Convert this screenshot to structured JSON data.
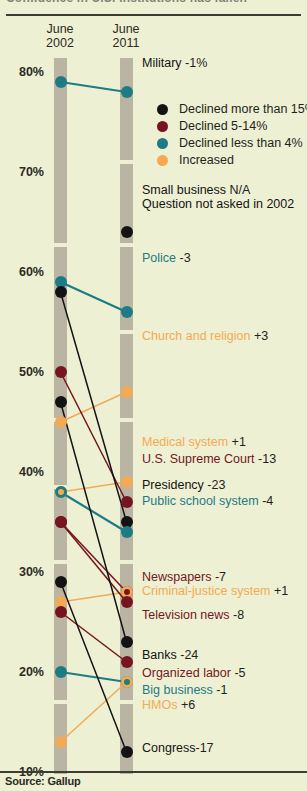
{
  "meta": {
    "clipped_title": "Confidence in U.S. institutions has fallen",
    "source": "Source: Gallup"
  },
  "columns": [
    {
      "key": "c2002",
      "line1": "June",
      "line2": "2002"
    },
    {
      "key": "c2011",
      "line1": "June",
      "line2": "2011"
    }
  ],
  "legend": {
    "items": [
      {
        "label": "Declined more than 15%",
        "color": "#131313",
        "key": "black"
      },
      {
        "label": "Declined 5-14%",
        "color": "#76151f",
        "key": "darkred"
      },
      {
        "label": "Declined less than 4%",
        "color": "#1d7b86",
        "key": "teal"
      },
      {
        "label": "Increased",
        "color": "#f2ab54",
        "key": "orange"
      }
    ]
  },
  "colors": {
    "black": "#131313",
    "darkred": "#76151f",
    "teal": "#1d7b86",
    "orange": "#f2ab54",
    "background": "#eef0d3",
    "track": "#b9b5a2",
    "rule": "#3c3c32"
  },
  "chart_data": {
    "type": "line",
    "title": "Confidence in U.S. institutions has fallen",
    "xlabel": "",
    "ylabel": "",
    "x": [
      "June 2002",
      "June 2011"
    ],
    "ylim": [
      10,
      80
    ],
    "yticks": [
      "80%",
      "70%",
      "60%",
      "50%",
      "40%",
      "30%",
      "20%",
      "10%"
    ],
    "ytick_values": [
      80,
      70,
      60,
      50,
      40,
      30,
      20,
      10
    ],
    "grid": false,
    "legend_position": "upper-right",
    "units": "percent expressing a great deal / quite a lot of confidence",
    "series": [
      {
        "name": "Military",
        "values": [
          79,
          78
        ],
        "delta": "-1%",
        "category": "teal",
        "label": "Military",
        "label_delta": "-1%"
      },
      {
        "name": "Small business",
        "values": [
          null,
          64
        ],
        "delta": "N/A",
        "category": "black",
        "label": "Small business",
        "label_delta": "N/A",
        "note": "Question not asked in 2002"
      },
      {
        "name": "Police",
        "values": [
          59,
          56
        ],
        "delta": "-3",
        "category": "teal",
        "label": "Police",
        "label_delta": "-3"
      },
      {
        "name": "Church and religion",
        "values": [
          45,
          48
        ],
        "delta": "+3",
        "category": "orange",
        "label": "Church and religion",
        "label_delta": "+3"
      },
      {
        "name": "Medical system",
        "values": [
          38,
          39
        ],
        "delta": "+1",
        "category": "orange",
        "label": "Medical system",
        "label_delta": "+1"
      },
      {
        "name": "U.S. Supreme Court",
        "values": [
          50,
          37
        ],
        "delta": "-13",
        "category": "darkred",
        "label": "U.S. Supreme Court",
        "label_delta": "-13"
      },
      {
        "name": "Presidency",
        "values": [
          58,
          35
        ],
        "delta": "-23",
        "category": "black",
        "label": "Presidency",
        "label_delta": "-23"
      },
      {
        "name": "Public school system",
        "values": [
          38,
          34
        ],
        "delta": "-4",
        "category": "teal",
        "label": "Public school system",
        "label_delta": "-4"
      },
      {
        "name": "Newspapers",
        "values": [
          35,
          28
        ],
        "delta": "-7",
        "category": "darkred",
        "label": "Newspapers",
        "label_delta": "-7"
      },
      {
        "name": "Criminal-justice system",
        "values": [
          27,
          28
        ],
        "delta": "+1",
        "category": "orange",
        "label": "Criminal-justice system",
        "label_delta": "+1"
      },
      {
        "name": "Television news",
        "values": [
          35,
          27
        ],
        "delta": "-8",
        "category": "darkred",
        "label": "Television news",
        "label_delta": "-8"
      },
      {
        "name": "Banks",
        "values": [
          47,
          23
        ],
        "delta": "-24",
        "category": "black",
        "label": "Banks",
        "label_delta": "-24"
      },
      {
        "name": "Organized labor",
        "values": [
          26,
          21
        ],
        "delta": "-5",
        "category": "darkred",
        "label": "Organized labor",
        "label_delta": "-5"
      },
      {
        "name": "Big business",
        "values": [
          20,
          19
        ],
        "delta": "-1",
        "category": "teal",
        "label": "Big business",
        "label_delta": "-1"
      },
      {
        "name": "HMOs",
        "values": [
          13,
          19
        ],
        "delta": "+6",
        "category": "orange",
        "label": "HMOs",
        "label_delta": "+6"
      },
      {
        "name": "Congress",
        "values": [
          29,
          12
        ],
        "delta": "-17",
        "category": "black",
        "label": "Congress",
        "label_delta": "-17"
      }
    ]
  },
  "labels": [
    {
      "text": "Military",
      "delta": " -1%",
      "color": "black",
      "x": 142,
      "y": 63
    },
    {
      "text": "Small business",
      "delta": " N/A",
      "color": "black",
      "x": 142,
      "y": 190
    },
    {
      "text": "Question not asked in 2002",
      "delta": "",
      "color": "black",
      "x": 142,
      "y": 204
    },
    {
      "text": "Police",
      "delta": " -3",
      "color": "teal",
      "x": 142,
      "y": 258
    },
    {
      "text": "Church and religion",
      "delta": " +3",
      "color": "orange",
      "x": 142,
      "y": 336
    },
    {
      "text": "Medical system",
      "delta": " +1",
      "color": "orange",
      "x": 142,
      "y": 442
    },
    {
      "text": "U.S. Supreme Court",
      "delta": " -13",
      "color": "darkred",
      "x": 142,
      "y": 459
    },
    {
      "text": "Presidency",
      "delta": " -23",
      "color": "black",
      "x": 142,
      "y": 485
    },
    {
      "text": "Public school system",
      "delta": " -4",
      "color": "teal",
      "x": 142,
      "y": 501
    },
    {
      "text": "Newspapers",
      "delta": " -7",
      "color": "darkred",
      "x": 142,
      "y": 577
    },
    {
      "text": "Criminal-justice system",
      "delta": " +1",
      "color": "orange",
      "x": 142,
      "y": 591
    },
    {
      "text": "Television news",
      "delta": " -8",
      "color": "darkred",
      "x": 142,
      "y": 615
    },
    {
      "text": "Banks",
      "delta": " -24",
      "color": "black",
      "x": 142,
      "y": 655
    },
    {
      "text": "Organized labor",
      "delta": " -5",
      "color": "darkred",
      "x": 142,
      "y": 673
    },
    {
      "text": "Big business",
      "delta": " -1",
      "color": "teal",
      "x": 142,
      "y": 690
    },
    {
      "text": "HMOs",
      "delta": " +6",
      "color": "orange",
      "x": 142,
      "y": 705
    },
    {
      "text": "Congress",
      "delta": "-17",
      "color": "black",
      "x": 142,
      "y": 748
    }
  ]
}
